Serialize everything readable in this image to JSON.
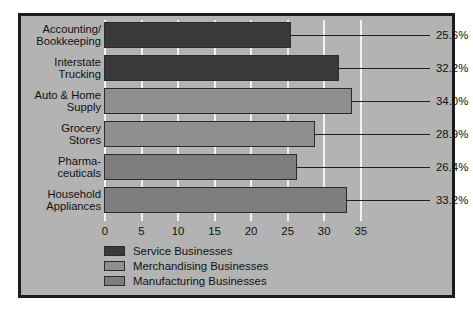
{
  "chart_data": {
    "type": "bar",
    "orientation": "horizontal",
    "title": "",
    "xlabel": "",
    "ylabel": "",
    "xlim": [
      0,
      37.5
    ],
    "xticks": [
      0,
      5,
      10,
      15,
      20,
      25,
      30,
      35
    ],
    "xtick_labels": [
      "0",
      "5",
      "10",
      "15",
      "20",
      "25",
      "30",
      "35"
    ],
    "grid": true,
    "grid_axis": "x",
    "legend_position": "bottom-left",
    "categories": [
      "Accounting/\nBookkeeping",
      "Interstate\nTrucking",
      "Auto & Home\nSupply",
      "Grocery\nStores",
      "Pharma-\nceuticals",
      "Household\nAppliances"
    ],
    "values": [
      25.6,
      32.2,
      34.0,
      28.9,
      26.4,
      33.2
    ],
    "value_labels": [
      "25.6%",
      "32.2%",
      "34.0%",
      "28.9%",
      "26.4%",
      "33.2%"
    ],
    "series_of_bar": [
      "Service Businesses",
      "Service Businesses",
      "Merchandising Businesses",
      "Merchandising Businesses",
      "Manufacturing Businesses",
      "Manufacturing Businesses"
    ],
    "bar_colors": [
      "#3a3a3a",
      "#3a3a3a",
      "#8f8f8f",
      "#8f8f8f",
      "#7d7d7d",
      "#7d7d7d"
    ],
    "legend": [
      {
        "label": "Service Businesses",
        "color": "#3a3a3a"
      },
      {
        "label": "Merchandising Businesses",
        "color": "#8f8f8f"
      },
      {
        "label": "Manufacturing Businesses",
        "color": "#7d7d7d"
      }
    ]
  },
  "colors": {
    "background": "#b3b3b3",
    "frame_border": "#1c1c1c",
    "gridline": "#f2f2f2",
    "text": "#111111",
    "bar_outline": "#2b2b2b"
  }
}
